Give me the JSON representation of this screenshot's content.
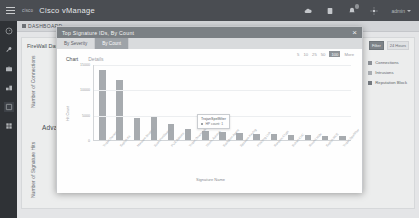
{
  "topbar": {
    "logo_text": "cisco",
    "title": "Cisco vManage",
    "icons": [
      "cloud-icon",
      "device-icon",
      "alarm-icon",
      "gear-icon"
    ],
    "user_label": "admin"
  },
  "rail": {
    "items": [
      {
        "name": "sidebar-item-dashboard",
        "icon": "speedometer-icon"
      },
      {
        "name": "sidebar-item-monitor",
        "icon": "wrench-icon"
      },
      {
        "name": "sidebar-item-configuration",
        "icon": "briefcase-icon"
      },
      {
        "name": "sidebar-item-tools",
        "icon": "tools-icon"
      },
      {
        "name": "sidebar-item-maintenance",
        "icon": "window-icon"
      },
      {
        "name": "sidebar-item-administration",
        "icon": "grid-icon"
      }
    ]
  },
  "page": {
    "tab_label": "DASHBOARD",
    "panel_title": "FireWall Dashlet",
    "left_axis_label": "Number of Connections",
    "bottom_axis_label": "Number of Signature Hits",
    "section_title": "Advanced Malware Protection",
    "legend": [
      {
        "label": "Connections",
        "color": "#8c9096"
      },
      {
        "label": "Intrusions",
        "color": "#a9adb2"
      },
      {
        "label": "Reputation Block",
        "color": "#74797f"
      }
    ],
    "toolbar": {
      "filter_label": "Filter",
      "range_label": "24 Hours"
    }
  },
  "modal": {
    "title": "Top Signature IDs, By Count",
    "close_label": "×",
    "tabs": [
      {
        "label": "By Severity",
        "active": false
      },
      {
        "label": "By Count",
        "active": true
      }
    ],
    "chart_tabs": [
      {
        "label": "Chart",
        "active": true
      },
      {
        "label": "Details",
        "active": false
      }
    ],
    "count_options": [
      "5",
      "10",
      "25",
      "50",
      "100"
    ],
    "count_selected": "100",
    "more_label": "More",
    "tooltip": {
      "title": "TrojanSpellfilter",
      "metric_label": "HP count: 1"
    }
  },
  "chart_data": {
    "type": "bar",
    "title": "Top Signature IDs, By Count",
    "xlabel": "Signature Name",
    "ylabel": "Hit Count",
    "ylim": [
      0,
      15000
    ],
    "yticks": [
      0,
      5000,
      10000,
      15000
    ],
    "grid": true,
    "legend": "none",
    "categories": [
      "Trojan.Generic",
      "Exploit.Kit",
      "Malware.Dropper",
      "Scan.PortSweep",
      "PUA.Adware",
      "Trojan.Downloader",
      "Worm.Autorun",
      "Backdoor.Agent",
      "Spyware.Keylog",
      "Phishing.Link",
      "Ransom.Crypt",
      "Botnet.CnC",
      "Rootkit.Hide",
      "Exploit.RCE",
      "Trojan.Spellfilter"
    ],
    "values": [
      13800,
      11900,
      4300,
      4600,
      3200,
      2100,
      1700,
      1500,
      1300,
      1200,
      1100,
      1000,
      900,
      800,
      700
    ]
  }
}
